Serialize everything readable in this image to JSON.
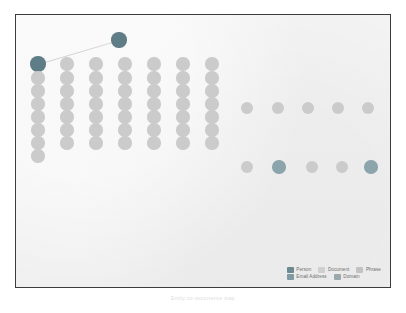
{
  "figure": {
    "caption": "Entity co-occurrence map",
    "background_color": "#f1f1f1",
    "frame_color": "#3c3c3c"
  },
  "palette": {
    "person": "#6d8a93",
    "email_address": "#7f9aa2",
    "document": "#cfcfcf",
    "domain": "#9aa9ad",
    "phrase": "#c2c2c2",
    "node_light": "#cbcbcb",
    "node_mid": "#b7bfc1",
    "node_dark": "#7d959c",
    "node_darkest": "#5f7d86",
    "edge": "#d3d3d3"
  },
  "legend": {
    "rows": [
      [
        {
          "label": "Person",
          "color": "#6d8a93",
          "key": "person"
        },
        {
          "label": "Document",
          "color": "#cfcfcf",
          "key": "document"
        },
        {
          "label": "Phrase",
          "color": "#c2c2c2",
          "key": "phrase"
        }
      ],
      [
        {
          "label": "Email Address",
          "color": "#7f9aa2",
          "key": "email-address"
        },
        {
          "label": "Domain",
          "color": "#9aa9ad",
          "key": "domain"
        }
      ]
    ]
  },
  "chart_data": {
    "type": "scatter",
    "title": "",
    "xlabel": "",
    "ylabel": "",
    "xlim": [
      0,
      376
    ],
    "ylim": [
      0,
      274
    ],
    "grid": false,
    "legend_position": "bottom-right",
    "edges": [
      {
        "x1": 22,
        "y1": 49,
        "x2": 103,
        "y2": 25
      }
    ],
    "series": [
      {
        "name": "Person",
        "color": "#5f7d86",
        "points": [
          {
            "x": 22,
            "y": 49,
            "r": 7.6
          },
          {
            "x": 103,
            "y": 25,
            "r": 7.6
          }
        ]
      },
      {
        "name": "Document",
        "color": "#cbcbcb",
        "points": [
          {
            "x": 22,
            "y": 63,
            "r": 6.6
          },
          {
            "x": 22,
            "y": 76,
            "r": 6.6
          },
          {
            "x": 22,
            "y": 89,
            "r": 6.6
          },
          {
            "x": 22,
            "y": 102,
            "r": 6.6
          },
          {
            "x": 22,
            "y": 115,
            "r": 6.6
          },
          {
            "x": 22,
            "y": 128,
            "r": 6.6
          },
          {
            "x": 22,
            "y": 141,
            "r": 6.6
          },
          {
            "x": 51,
            "y": 49,
            "r": 6.6
          },
          {
            "x": 51,
            "y": 63,
            "r": 6.6
          },
          {
            "x": 51,
            "y": 76,
            "r": 6.6
          },
          {
            "x": 51,
            "y": 89,
            "r": 6.6
          },
          {
            "x": 51,
            "y": 102,
            "r": 6.6
          },
          {
            "x": 51,
            "y": 115,
            "r": 6.6
          },
          {
            "x": 51,
            "y": 128,
            "r": 6.6
          },
          {
            "x": 80,
            "y": 49,
            "r": 6.6
          },
          {
            "x": 80,
            "y": 63,
            "r": 6.6
          },
          {
            "x": 80,
            "y": 76,
            "r": 6.6
          },
          {
            "x": 80,
            "y": 89,
            "r": 6.6
          },
          {
            "x": 80,
            "y": 102,
            "r": 6.6
          },
          {
            "x": 80,
            "y": 115,
            "r": 6.6
          },
          {
            "x": 80,
            "y": 128,
            "r": 6.6
          },
          {
            "x": 109,
            "y": 49,
            "r": 6.6
          },
          {
            "x": 109,
            "y": 63,
            "r": 6.6
          },
          {
            "x": 109,
            "y": 76,
            "r": 6.6
          },
          {
            "x": 109,
            "y": 89,
            "r": 6.6
          },
          {
            "x": 109,
            "y": 102,
            "r": 6.6
          },
          {
            "x": 109,
            "y": 115,
            "r": 6.6
          },
          {
            "x": 109,
            "y": 128,
            "r": 6.6
          },
          {
            "x": 138,
            "y": 49,
            "r": 6.6
          },
          {
            "x": 138,
            "y": 63,
            "r": 6.6
          },
          {
            "x": 138,
            "y": 76,
            "r": 6.6
          },
          {
            "x": 138,
            "y": 89,
            "r": 6.6
          },
          {
            "x": 138,
            "y": 102,
            "r": 6.6
          },
          {
            "x": 138,
            "y": 115,
            "r": 6.6
          },
          {
            "x": 138,
            "y": 128,
            "r": 6.6
          },
          {
            "x": 167,
            "y": 49,
            "r": 6.6
          },
          {
            "x": 167,
            "y": 63,
            "r": 6.6
          },
          {
            "x": 167,
            "y": 76,
            "r": 6.6
          },
          {
            "x": 167,
            "y": 89,
            "r": 6.6
          },
          {
            "x": 167,
            "y": 102,
            "r": 6.6
          },
          {
            "x": 167,
            "y": 115,
            "r": 6.6
          },
          {
            "x": 167,
            "y": 128,
            "r": 6.6
          },
          {
            "x": 196,
            "y": 49,
            "r": 6.6
          },
          {
            "x": 196,
            "y": 63,
            "r": 6.6
          },
          {
            "x": 196,
            "y": 76,
            "r": 6.6
          },
          {
            "x": 196,
            "y": 89,
            "r": 6.6
          },
          {
            "x": 196,
            "y": 102,
            "r": 6.6
          },
          {
            "x": 196,
            "y": 115,
            "r": 6.6
          },
          {
            "x": 196,
            "y": 128,
            "r": 6.6
          },
          {
            "x": 231,
            "y": 93,
            "r": 6.2
          },
          {
            "x": 262,
            "y": 93,
            "r": 6.2
          },
          {
            "x": 292,
            "y": 93,
            "r": 6.2
          },
          {
            "x": 322,
            "y": 93,
            "r": 6.2
          },
          {
            "x": 352,
            "y": 93,
            "r": 6.2
          },
          {
            "x": 382,
            "y": 93,
            "r": 6.2
          },
          {
            "x": 412,
            "y": 93,
            "r": 6.2
          },
          {
            "x": 442,
            "y": 93,
            "r": 6.2
          }
        ]
      },
      {
        "name": "Mixed lower row",
        "color": "#9aa9ad",
        "points": [
          {
            "x": 231,
            "y": 152,
            "r": 6.4,
            "fill": "#cbcbcb"
          },
          {
            "x": 263,
            "y": 152,
            "r": 6.8,
            "fill": "#8ca4ab"
          },
          {
            "x": 296,
            "y": 152,
            "r": 6.4,
            "fill": "#cbcbcb"
          },
          {
            "x": 326,
            "y": 152,
            "r": 6.4,
            "fill": "#cbcbcb"
          },
          {
            "x": 355,
            "y": 152,
            "r": 6.8,
            "fill": "#8ca4ab"
          },
          {
            "x": 384,
            "y": 152,
            "r": 6.4,
            "fill": "#c4c9cb"
          },
          {
            "x": 416,
            "y": 152,
            "r": 7.6,
            "fill": "#9fb2b7",
            "ring": true
          },
          {
            "x": 447,
            "y": 152,
            "r": 6.4,
            "fill": "#cbcbcb"
          },
          {
            "x": 466,
            "y": 152,
            "r": 6.6,
            "fill": "#8ca4ab"
          },
          {
            "x": 494,
            "y": 152,
            "r": 6.4,
            "fill": "#cbcbcb"
          },
          {
            "x": 513,
            "y": 152,
            "r": 6.6,
            "fill": "#8ca4ab"
          }
        ]
      }
    ]
  }
}
